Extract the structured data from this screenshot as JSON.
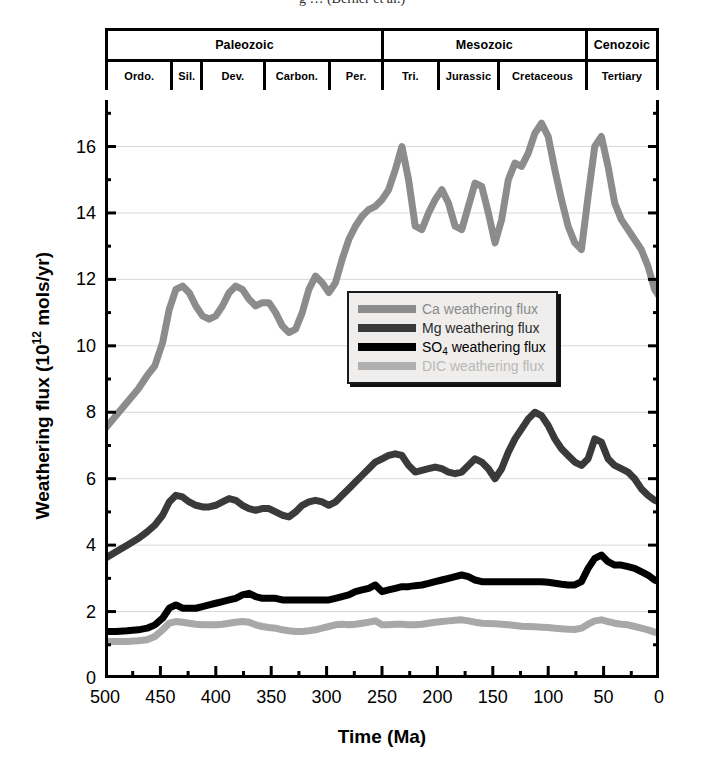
{
  "caption_sliver": "g   …   (Berner et al.)",
  "timescale": {
    "eras": [
      {
        "label": "Paleozoic",
        "from_ma": 500,
        "to_ma": 251
      },
      {
        "label": "Mesozoic",
        "from_ma": 251,
        "to_ma": 65
      },
      {
        "label": "Cenozoic",
        "from_ma": 65,
        "to_ma": 0
      }
    ],
    "periods": [
      {
        "label": "Ordo.",
        "from_ma": 500,
        "to_ma": 443
      },
      {
        "label": "Sil.",
        "from_ma": 443,
        "to_ma": 416
      },
      {
        "label": "Dev.",
        "from_ma": 416,
        "to_ma": 359
      },
      {
        "label": "Carbon.",
        "from_ma": 359,
        "to_ma": 299
      },
      {
        "label": "Per.",
        "from_ma": 299,
        "to_ma": 251
      },
      {
        "label": "Tri.",
        "from_ma": 251,
        "to_ma": 200
      },
      {
        "label": "Jurassic",
        "from_ma": 200,
        "to_ma": 145
      },
      {
        "label": "Cretaceous",
        "from_ma": 145,
        "to_ma": 65
      },
      {
        "label": "Tertiary",
        "from_ma": 65,
        "to_ma": 0
      }
    ]
  },
  "chart_data": {
    "type": "line",
    "title": "",
    "xlabel": "Time (Ma)",
    "ylabel": "Weathering flux (10^12 mols/yr)",
    "ylabel_html": "Weathering flux (10<sup>12</sup> mols/yr)",
    "xlim": [
      500,
      0
    ],
    "ylim": [
      0,
      17.4
    ],
    "x_reversed": true,
    "xticks": [
      500,
      450,
      400,
      350,
      300,
      250,
      200,
      150,
      100,
      50,
      0
    ],
    "yticks": [
      0,
      2,
      4,
      6,
      8,
      10,
      12,
      14,
      16
    ],
    "y_minor_step": 1,
    "grid": "horizontal-major-faint",
    "legend_position": "center",
    "colors": {
      "ca": "#8c8c8c",
      "mg": "#3a3a3a",
      "so4": "#000000",
      "dic": "#a8a8a8",
      "axis": "#000000",
      "grid": "#d8d8d8"
    },
    "series": [
      {
        "name": "Ca weathering flux",
        "color": "#8c8c8c",
        "x": [
          500,
          490,
          480,
          470,
          462,
          455,
          448,
          442,
          436,
          430,
          424,
          418,
          412,
          406,
          400,
          394,
          388,
          382,
          376,
          370,
          364,
          358,
          352,
          346,
          340,
          334,
          328,
          322,
          316,
          310,
          304,
          298,
          292,
          286,
          280,
          274,
          268,
          262,
          256,
          250,
          244,
          238,
          232,
          226,
          220,
          214,
          208,
          202,
          196,
          190,
          184,
          178,
          172,
          166,
          160,
          154,
          148,
          142,
          136,
          130,
          124,
          118,
          112,
          106,
          100,
          94,
          88,
          82,
          76,
          70,
          64,
          58,
          52,
          46,
          40,
          34,
          28,
          22,
          16,
          10,
          4,
          0
        ],
        "y": [
          7.5,
          7.9,
          8.3,
          8.7,
          9.1,
          9.4,
          10.1,
          11.1,
          11.7,
          11.8,
          11.6,
          11.2,
          10.9,
          10.8,
          10.9,
          11.2,
          11.6,
          11.8,
          11.7,
          11.4,
          11.2,
          11.3,
          11.3,
          11.0,
          10.6,
          10.4,
          10.5,
          11.0,
          11.7,
          12.1,
          11.9,
          11.6,
          11.9,
          12.6,
          13.2,
          13.6,
          13.9,
          14.1,
          14.2,
          14.4,
          14.7,
          15.3,
          16.0,
          15.0,
          13.6,
          13.5,
          14.0,
          14.4,
          14.7,
          14.3,
          13.6,
          13.5,
          14.2,
          14.9,
          14.8,
          14.0,
          13.1,
          13.8,
          15.0,
          15.5,
          15.4,
          15.8,
          16.4,
          16.7,
          16.3,
          15.3,
          14.4,
          13.6,
          13.1,
          12.9,
          14.5,
          16.0,
          16.3,
          15.4,
          14.3,
          13.8,
          13.5,
          13.2,
          12.9,
          12.4,
          11.7,
          11.5
        ]
      },
      {
        "name": "Mg weathering flux",
        "color": "#3a3a3a",
        "x": [
          500,
          490,
          480,
          470,
          462,
          455,
          448,
          442,
          436,
          430,
          424,
          418,
          412,
          406,
          400,
          394,
          388,
          382,
          376,
          370,
          364,
          358,
          352,
          346,
          340,
          334,
          328,
          322,
          316,
          310,
          304,
          298,
          292,
          286,
          280,
          274,
          268,
          262,
          256,
          250,
          244,
          238,
          232,
          226,
          220,
          214,
          208,
          202,
          196,
          190,
          184,
          178,
          172,
          166,
          160,
          154,
          148,
          142,
          136,
          130,
          124,
          118,
          112,
          106,
          100,
          94,
          88,
          82,
          76,
          70,
          64,
          58,
          52,
          46,
          40,
          34,
          28,
          22,
          16,
          10,
          4,
          0
        ],
        "y": [
          3.6,
          3.8,
          4.0,
          4.2,
          4.4,
          4.6,
          4.9,
          5.3,
          5.5,
          5.45,
          5.3,
          5.2,
          5.15,
          5.15,
          5.2,
          5.3,
          5.4,
          5.35,
          5.2,
          5.1,
          5.05,
          5.1,
          5.1,
          5.0,
          4.9,
          4.85,
          5.0,
          5.2,
          5.3,
          5.35,
          5.3,
          5.2,
          5.3,
          5.5,
          5.7,
          5.9,
          6.1,
          6.3,
          6.5,
          6.6,
          6.7,
          6.75,
          6.7,
          6.4,
          6.2,
          6.25,
          6.3,
          6.35,
          6.3,
          6.2,
          6.15,
          6.2,
          6.4,
          6.6,
          6.5,
          6.3,
          6.0,
          6.3,
          6.8,
          7.2,
          7.5,
          7.8,
          8.0,
          7.9,
          7.6,
          7.2,
          6.9,
          6.7,
          6.5,
          6.4,
          6.6,
          7.2,
          7.1,
          6.6,
          6.4,
          6.3,
          6.2,
          6.0,
          5.7,
          5.5,
          5.35,
          5.3
        ]
      },
      {
        "name": "SO4 weathering flux",
        "color": "#000000",
        "x": [
          500,
          490,
          480,
          470,
          462,
          455,
          448,
          442,
          436,
          430,
          424,
          418,
          412,
          406,
          400,
          394,
          388,
          382,
          376,
          370,
          364,
          358,
          352,
          346,
          340,
          334,
          328,
          322,
          316,
          310,
          304,
          298,
          292,
          286,
          280,
          274,
          268,
          262,
          256,
          250,
          244,
          238,
          232,
          226,
          220,
          214,
          208,
          202,
          196,
          190,
          184,
          178,
          172,
          166,
          160,
          154,
          148,
          142,
          136,
          130,
          124,
          118,
          112,
          106,
          100,
          94,
          88,
          82,
          76,
          70,
          64,
          58,
          52,
          46,
          40,
          34,
          28,
          22,
          16,
          10,
          4,
          0
        ],
        "y": [
          1.4,
          1.4,
          1.42,
          1.45,
          1.5,
          1.6,
          1.8,
          2.1,
          2.2,
          2.1,
          2.1,
          2.1,
          2.15,
          2.2,
          2.25,
          2.3,
          2.35,
          2.4,
          2.5,
          2.55,
          2.45,
          2.4,
          2.4,
          2.4,
          2.35,
          2.35,
          2.35,
          2.35,
          2.35,
          2.35,
          2.35,
          2.35,
          2.4,
          2.45,
          2.5,
          2.6,
          2.65,
          2.7,
          2.8,
          2.6,
          2.65,
          2.7,
          2.75,
          2.75,
          2.78,
          2.8,
          2.85,
          2.9,
          2.95,
          3.0,
          3.05,
          3.1,
          3.05,
          2.95,
          2.9,
          2.9,
          2.9,
          2.9,
          2.9,
          2.9,
          2.9,
          2.9,
          2.9,
          2.9,
          2.88,
          2.85,
          2.82,
          2.8,
          2.8,
          2.9,
          3.3,
          3.6,
          3.7,
          3.5,
          3.4,
          3.4,
          3.35,
          3.3,
          3.2,
          3.1,
          2.95,
          2.9
        ]
      },
      {
        "name": "DIC weathering flux",
        "color": "#a8a8a8",
        "x": [
          500,
          490,
          480,
          470,
          462,
          455,
          448,
          442,
          436,
          430,
          424,
          418,
          412,
          406,
          400,
          394,
          388,
          382,
          376,
          370,
          364,
          358,
          352,
          346,
          340,
          334,
          328,
          322,
          316,
          310,
          304,
          298,
          292,
          286,
          280,
          274,
          268,
          262,
          256,
          250,
          244,
          238,
          232,
          226,
          220,
          214,
          208,
          202,
          196,
          190,
          184,
          178,
          172,
          166,
          160,
          154,
          148,
          142,
          136,
          130,
          124,
          118,
          112,
          106,
          100,
          94,
          88,
          82,
          76,
          70,
          64,
          58,
          52,
          46,
          40,
          34,
          28,
          22,
          16,
          10,
          4,
          0
        ],
        "y": [
          1.1,
          1.1,
          1.1,
          1.12,
          1.15,
          1.25,
          1.45,
          1.65,
          1.7,
          1.68,
          1.65,
          1.62,
          1.6,
          1.6,
          1.6,
          1.62,
          1.65,
          1.68,
          1.7,
          1.68,
          1.6,
          1.55,
          1.52,
          1.5,
          1.45,
          1.42,
          1.4,
          1.4,
          1.42,
          1.45,
          1.5,
          1.55,
          1.6,
          1.62,
          1.6,
          1.62,
          1.65,
          1.68,
          1.72,
          1.6,
          1.6,
          1.62,
          1.62,
          1.6,
          1.6,
          1.62,
          1.65,
          1.68,
          1.7,
          1.72,
          1.74,
          1.75,
          1.72,
          1.68,
          1.65,
          1.64,
          1.63,
          1.62,
          1.6,
          1.58,
          1.56,
          1.55,
          1.54,
          1.53,
          1.52,
          1.5,
          1.48,
          1.47,
          1.46,
          1.5,
          1.62,
          1.72,
          1.75,
          1.7,
          1.65,
          1.62,
          1.6,
          1.55,
          1.5,
          1.45,
          1.38,
          1.35
        ]
      }
    ]
  },
  "legend": {
    "items": [
      {
        "label": "Ca weathering flux",
        "color": "#8c8c8c",
        "text_color": "#8a8a8a"
      },
      {
        "label": "Mg weathering flux",
        "color": "#3a3a3a",
        "text_color": "#2b2b2b"
      },
      {
        "label": "SO4 weathering flux",
        "label_main": "SO",
        "label_sub": "4",
        "label_rest": " weathering flux",
        "color": "#000000",
        "text_color": "#000000"
      },
      {
        "label": "DIC weathering flux",
        "color": "#b0b0b0",
        "text_color": "#b8b8b8"
      }
    ]
  }
}
